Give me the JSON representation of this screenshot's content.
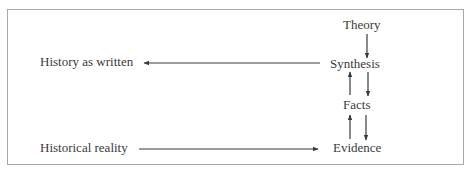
{
  "diagram": {
    "nodes": {
      "theory": "Theory",
      "synthesis": "Synthesis",
      "facts": "Facts",
      "evidence": "Evidence",
      "history_as_written": "History as written",
      "historical_reality": "Historical reality"
    },
    "edges": [
      {
        "from": "Theory",
        "to": "Synthesis"
      },
      {
        "from": "Synthesis",
        "to": "Facts"
      },
      {
        "from": "Facts",
        "to": "Synthesis"
      },
      {
        "from": "Facts",
        "to": "Evidence"
      },
      {
        "from": "Evidence",
        "to": "Facts"
      },
      {
        "from": "Synthesis",
        "to": "History as written"
      },
      {
        "from": "Historical reality",
        "to": "Evidence"
      }
    ],
    "colors": {
      "text": "#3a3a3a",
      "arrow": "#3a3a3a",
      "border": "#a8a8a8"
    }
  }
}
